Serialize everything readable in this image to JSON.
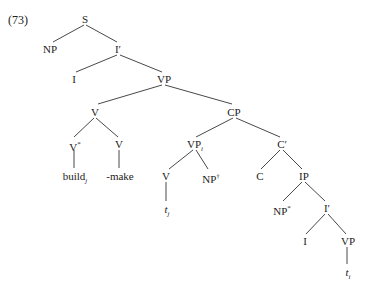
{
  "example_number": "(73)",
  "tree": {
    "S": "S",
    "NP_subj": "NP",
    "Ibar_top": "I′",
    "I_top": "I",
    "VP_top": "VP",
    "V_complex": "V",
    "CP": "CP",
    "V_star": "V",
    "V_star_mark": "*",
    "V_make": "V",
    "build": "build",
    "build_sub": "j",
    "make": "-make",
    "VP_i": "VP",
    "VP_i_sub": "i",
    "Cbar": "C′",
    "V_low": "V",
    "NP_dagger": "NP",
    "NP_dagger_mark": "†",
    "C": "C",
    "IP": "IP",
    "t_j": "t",
    "t_j_sub": "j",
    "NP_star": "NP",
    "NP_star_mark": "*",
    "Ibar_low": "I′",
    "I_low": "I",
    "VP_low": "VP",
    "t_i": "t",
    "t_i_sub": "i"
  },
  "colors": {
    "line": "#333333",
    "text": "#222222",
    "background": "#ffffff"
  }
}
